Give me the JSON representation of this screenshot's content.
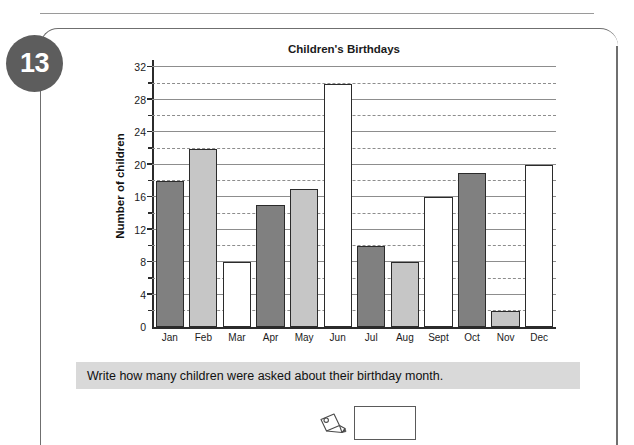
{
  "page": {
    "header_text": "",
    "question_number": "13"
  },
  "chart_data": {
    "type": "bar",
    "title": "Children's Birthdays",
    "xlabel": "",
    "ylabel": "Number of children",
    "ylim": [
      0,
      32
    ],
    "ytick_step": 4,
    "minor_tick_step": 2,
    "grid": "solid at labelled multiples of 4, dashed at intermediate multiples of 2",
    "legend": "none",
    "categories": [
      "Jan",
      "Feb",
      "Mar",
      "Apr",
      "May",
      "Jun",
      "Jul",
      "Aug",
      "Sept",
      "Oct",
      "Nov",
      "Dec"
    ],
    "values": [
      18,
      22,
      8,
      15,
      17,
      30,
      10,
      8,
      16,
      19,
      2,
      20
    ],
    "bar_fills": [
      "dark",
      "light",
      "white",
      "dark",
      "light",
      "white",
      "dark",
      "light",
      "white",
      "dark",
      "light",
      "white"
    ],
    "ytick_labels": [
      "0",
      "4",
      "8",
      "12",
      "16",
      "20",
      "24",
      "28",
      "32"
    ],
    "colors": {
      "dark": "#808080",
      "light": "#c6c6c6",
      "white": "#ffffff",
      "outline": "#2b2b2b",
      "gridline": "#8d8d8d"
    }
  },
  "prompt": {
    "text": "Write how many children were asked about their birthday month."
  },
  "answer": {
    "value": "",
    "placeholder": ""
  }
}
